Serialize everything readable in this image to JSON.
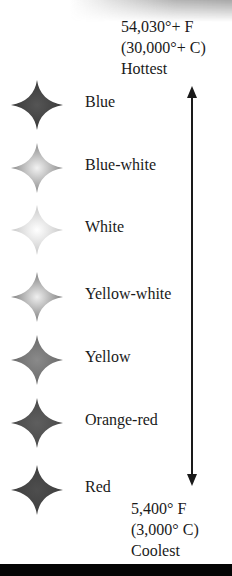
{
  "scale": {
    "hottest": {
      "fahrenheit": "54,030°+ F",
      "celsius": "(30,000°+ C)",
      "label": "Hottest"
    },
    "coolest": {
      "fahrenheit": "5,400° F",
      "celsius": "(3,000° C)",
      "label": "Coolest"
    }
  },
  "stars": [
    {
      "label": "Blue",
      "edge": "#3a3a3a",
      "center": "#555555"
    },
    {
      "label": "Blue-white",
      "edge": "#8a8a8a",
      "center": "#f2f2f2"
    },
    {
      "label": "White",
      "edge": "#c8c8c8",
      "center": "#ffffff"
    },
    {
      "label": "Yellow-white",
      "edge": "#7e7e7e",
      "center": "#efefef"
    },
    {
      "label": "Yellow",
      "edge": "#6a6a6a",
      "center": "#8a8a8a"
    },
    {
      "label": "Orange-red",
      "edge": "#4a4a4a",
      "center": "#5e5e5e"
    },
    {
      "label": "Red",
      "edge": "#3e3e3e",
      "center": "#4e4e4e"
    }
  ]
}
